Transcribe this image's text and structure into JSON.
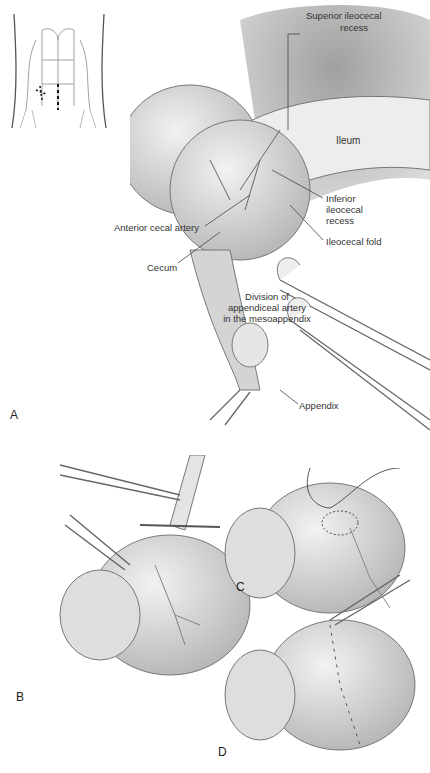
{
  "figure": {
    "panels": [
      {
        "id": "A",
        "label": "A"
      },
      {
        "id": "B",
        "label": "B"
      },
      {
        "id": "C",
        "label": "C"
      },
      {
        "id": "D",
        "label": "D"
      }
    ],
    "inset": {
      "name": "abdomen-incision-inset",
      "description": "torso with right lower quadrant incision marks and midline dashed line"
    },
    "labels": {
      "superior_ileocecal_recess_1": "Superior ileocecal",
      "superior_ileocecal_recess_2": "recess",
      "ileum": "Ileum",
      "inferior_ileocecal_recess_1": "Inferior",
      "inferior_ileocecal_recess_2": "ileocecal",
      "inferior_ileocecal_recess_3": "recess",
      "anterior_cecal_artery": "Anterior cecal artery",
      "ileocecal_fold": "Ileocecal fold",
      "cecum": "Cecum",
      "division_1": "Division of",
      "division_2": "appendiceal artery",
      "division_3": "in the mesoappendix",
      "appendix": "Appendix"
    },
    "colors": {
      "background": "#ffffff",
      "tissue_light": "#e6e6e6",
      "tissue_mid": "#c8c8c8",
      "tissue_dark": "#8a8a8a",
      "line": "#555555",
      "instrument": "#d9d9d9"
    }
  }
}
